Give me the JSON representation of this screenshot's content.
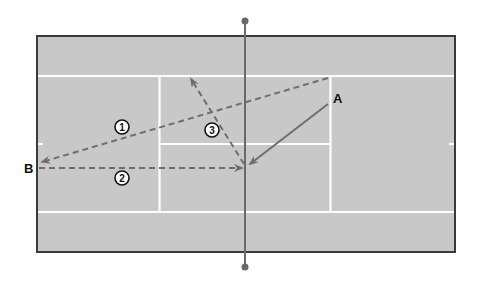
{
  "diagram": {
    "type": "tennis-court-tactics",
    "colors": {
      "court_fill": "#c8c8c8",
      "court_border": "#3a3a3a",
      "court_lines": "#ffffff",
      "net": "#6a6a6a",
      "arrows": "#6e6e6e",
      "text": "#111111",
      "badge_fill": "#ffffff",
      "badge_stroke": "#111111"
    },
    "players": [
      {
        "id": "A",
        "label": "A"
      },
      {
        "id": "B",
        "label": "B"
      }
    ],
    "shots": [
      {
        "id": "A-approach",
        "style": "solid",
        "from": "A",
        "to": "net-position"
      },
      {
        "id": "1",
        "label": "1",
        "style": "dashed",
        "description": "crosscourt to B"
      },
      {
        "id": "2",
        "label": "2",
        "style": "dashed",
        "description": "B down the line to net"
      },
      {
        "id": "3",
        "label": "3",
        "style": "dashed",
        "description": "volley to service box corner"
      }
    ]
  }
}
